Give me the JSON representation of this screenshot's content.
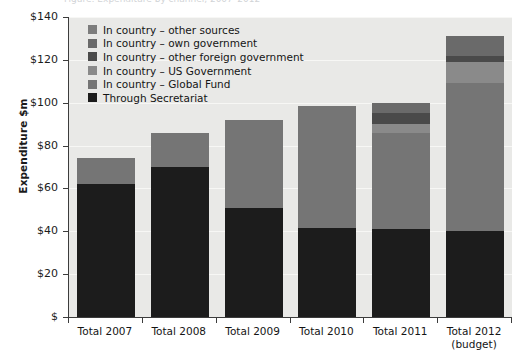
{
  "title_sliver": "Figure: Expenditure by channel, 2007–2012",
  "axes": {
    "ylabel": "Expenditure $m",
    "ytick_labels": [
      "$140",
      "$120",
      "$100",
      "$80",
      "$60",
      "$40",
      "$20",
      "$"
    ],
    "ytick_values": [
      140,
      120,
      100,
      80,
      60,
      40,
      20,
      0
    ]
  },
  "legend": {
    "items": [
      {
        "label": "In country – other sources",
        "color": "#7d7d7d"
      },
      {
        "label": "In country – own government",
        "color": "#6a6a6a"
      },
      {
        "label": "In country – other foreign government",
        "color": "#4a4a4a"
      },
      {
        "label": "In country – US Government",
        "color": "#8a8a8a"
      },
      {
        "label": "In country – Global Fund",
        "color": "#757575"
      },
      {
        "label": "Through Secretariat",
        "color": "#1c1c1c"
      }
    ]
  },
  "chart_data": {
    "type": "bar",
    "stacked": true,
    "title": "Expenditure by channel, 2007–2012",
    "xlabel": "",
    "ylabel": "Expenditure $m",
    "ylim": [
      0,
      140
    ],
    "ytick_step": 20,
    "grid": true,
    "legend_position": "inside top-left",
    "categories": [
      "Total 2007",
      "Total 2008",
      "Total 2009",
      "Total 2010",
      "Total 2011",
      "Total 2012 (budget)"
    ],
    "category_lines": [
      [
        "Total 2007"
      ],
      [
        "Total 2008"
      ],
      [
        "Total 2009"
      ],
      [
        "Total 2010"
      ],
      [
        "Total 2011"
      ],
      [
        "Total 2012",
        "(budget)"
      ]
    ],
    "series": [
      {
        "name": "Through Secretariat",
        "color": "#1c1c1c",
        "values": [
          62,
          70,
          51,
          41.5,
          41,
          40
        ]
      },
      {
        "name": "In country – Global Fund",
        "color": "#757575",
        "values": [
          12,
          16,
          41,
          57,
          45,
          69
        ]
      },
      {
        "name": "In country – US Government",
        "color": "#8a8a8a",
        "values": [
          0,
          0,
          0,
          0,
          4,
          10
        ]
      },
      {
        "name": "In country – other foreign government",
        "color": "#4a4a4a",
        "values": [
          0,
          0,
          0,
          0,
          5,
          3
        ]
      },
      {
        "name": "In country – own government",
        "color": "#6a6a6a",
        "values": [
          0,
          0,
          0,
          0,
          5,
          9
        ]
      },
      {
        "name": "In country – other sources",
        "color": "#7d7d7d",
        "values": [
          0,
          0,
          0,
          0,
          0,
          0
        ]
      }
    ],
    "totals": [
      74,
      86,
      92,
      98.5,
      100,
      131
    ]
  },
  "style": {
    "plot_background": "#e9e9e7",
    "gridline_color": "#f7f7f5",
    "axis_color": "#3c3c3c",
    "page_background": "#ffffff"
  }
}
